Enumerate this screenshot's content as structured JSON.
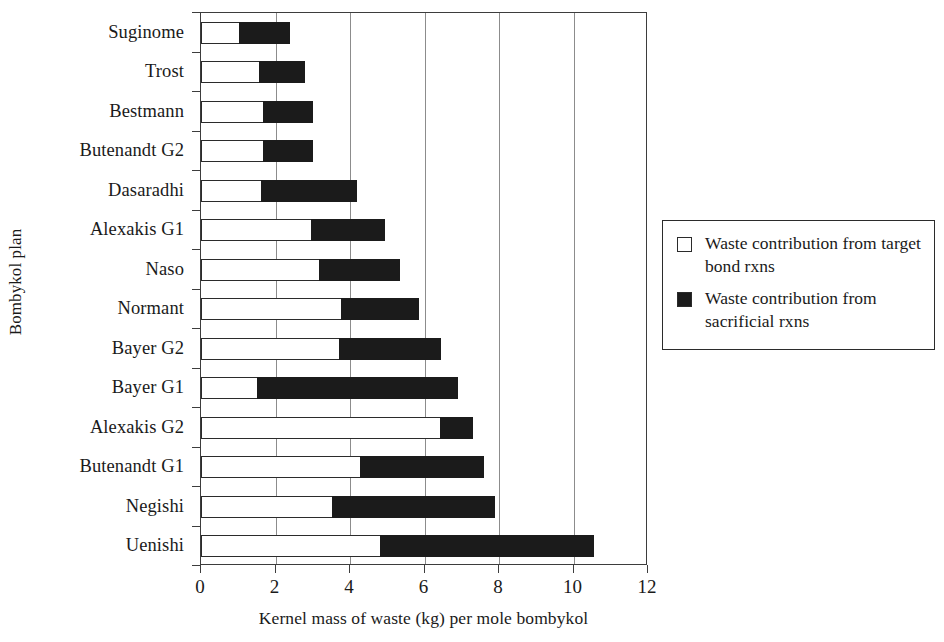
{
  "chart_data": {
    "type": "bar",
    "orientation": "horizontal",
    "stacked": true,
    "title": "",
    "xlabel": "Kernel mass of waste (kg) per mole bombykol",
    "ylabel": "Bombykol plan",
    "xlim": [
      0,
      12
    ],
    "xticks": [
      0,
      2,
      4,
      6,
      8,
      10,
      12
    ],
    "xtick_labels": [
      "0",
      "2",
      "4",
      "6",
      "8",
      "10",
      "12"
    ],
    "grid": "vertical",
    "legend_position": "right",
    "categories": [
      "Suginome",
      "Trost",
      "Bestmann",
      "Butenandt G2",
      "Dasaradhi",
      "Alexakis G1",
      "Naso",
      "Normant",
      "Bayer G2",
      "Bayer G1",
      "Alexakis G2",
      "Butenandt G1",
      "Negishi",
      "Uenishi"
    ],
    "series": [
      {
        "name": "Waste contribution from target bond rxns",
        "color": "#ffffff",
        "edge_color": "#2b2b2b",
        "values": [
          1.05,
          1.6,
          1.7,
          1.7,
          1.65,
          3.0,
          3.2,
          3.8,
          3.75,
          1.55,
          6.45,
          4.3,
          3.55,
          4.85
        ]
      },
      {
        "name": "Waste contribution from sacrificial rxns",
        "color": "#1b1b1b",
        "edge_color": "#1b1b1b",
        "values": [
          1.35,
          1.2,
          1.3,
          1.3,
          2.55,
          1.95,
          2.15,
          2.05,
          2.7,
          5.35,
          0.85,
          3.3,
          4.35,
          5.7
        ]
      }
    ],
    "totals": [
      2.4,
      2.8,
      3.0,
      3.0,
      4.2,
      4.95,
      5.35,
      5.85,
      6.45,
      6.9,
      7.3,
      7.6,
      7.9,
      10.55
    ]
  },
  "legend": {
    "entries": [
      {
        "swatch": "hollow-square",
        "label": "Waste contribution from target bond rxns"
      },
      {
        "swatch": "filled-square",
        "label": "Waste contribution from sacrificial rxns"
      }
    ]
  },
  "colors": {
    "target_bond": "#ffffff",
    "sacrificial": "#1b1b1b",
    "axis": "#3d3d3d",
    "grid": "#8c8c8c",
    "background": "#ffffff"
  }
}
